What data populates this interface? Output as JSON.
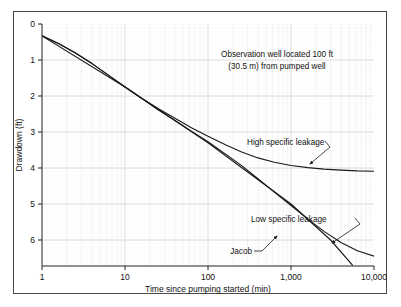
{
  "figure": {
    "background_color": "#ffffff",
    "frame_color": "#4a4a4a",
    "grid_color": "#d8d8d8",
    "grid_minor_color": "#e9e9e9",
    "curve_color": "#1a1a1a"
  },
  "annotations": {
    "note_line1": "Observation well located 100 ft",
    "note_line2": "(30.5 m) from pumped well",
    "high_leakage_label": "High specific leakage",
    "low_leakage_label": "Low specific leakage",
    "jacob_label": "Jacob"
  },
  "chart_data": {
    "type": "line",
    "title": "",
    "xlabel": "Time since pumping started (min)",
    "ylabel": "Drawdown (ft)",
    "xscale": "log",
    "yscale": "linear",
    "y_inverted": true,
    "xlim": [
      1,
      10000
    ],
    "ylim": [
      0,
      6.7
    ],
    "xticks": [
      1,
      10,
      100,
      1000,
      10000
    ],
    "xtick_labels": [
      "1",
      "10",
      "100",
      "1,000",
      "10,000"
    ],
    "yticks": [
      0,
      1,
      2,
      3,
      4,
      5,
      6
    ],
    "ytick_labels": [
      "0",
      "1",
      "2",
      "3",
      "4",
      "5",
      "6"
    ],
    "grid": true,
    "grid_style": "semi-log graph paper, minor log divisions on x, minor linear divisions on y",
    "legend": "none (curves labeled with leader lines)",
    "series": [
      {
        "name": "High specific leakage",
        "style": "solid",
        "points": [
          [
            1,
            0.33
          ],
          [
            1.6,
            0.55
          ],
          [
            2.5,
            0.8
          ],
          [
            4,
            1.1
          ],
          [
            6.3,
            1.42
          ],
          [
            10,
            1.75
          ],
          [
            16,
            2.07
          ],
          [
            25,
            2.35
          ],
          [
            40,
            2.62
          ],
          [
            63,
            2.88
          ],
          [
            100,
            3.12
          ],
          [
            160,
            3.35
          ],
          [
            250,
            3.55
          ],
          [
            400,
            3.72
          ],
          [
            630,
            3.84
          ],
          [
            1000,
            3.93
          ],
          [
            1600,
            3.99
          ],
          [
            2500,
            4.03
          ],
          [
            4000,
            4.06
          ],
          [
            6300,
            4.08
          ],
          [
            10000,
            4.09
          ]
        ]
      },
      {
        "name": "Low specific leakage",
        "style": "solid",
        "points": [
          [
            1,
            0.33
          ],
          [
            1.6,
            0.55
          ],
          [
            2.5,
            0.8
          ],
          [
            4,
            1.1
          ],
          [
            6.3,
            1.42
          ],
          [
            10,
            1.75
          ],
          [
            16,
            2.07
          ],
          [
            25,
            2.38
          ],
          [
            40,
            2.68
          ],
          [
            63,
            2.98
          ],
          [
            100,
            3.27
          ],
          [
            160,
            3.6
          ],
          [
            250,
            3.92
          ],
          [
            400,
            4.3
          ],
          [
            630,
            4.67
          ],
          [
            1000,
            5.04
          ],
          [
            1600,
            5.42
          ],
          [
            2500,
            5.76
          ],
          [
            4000,
            6.07
          ],
          [
            6300,
            6.3
          ],
          [
            10000,
            6.45
          ]
        ]
      },
      {
        "name": "Jacob",
        "style": "solid straight line (semi-log straight-line approximation)",
        "points": [
          [
            1,
            0.33
          ],
          [
            10,
            1.75
          ],
          [
            100,
            3.3
          ],
          [
            1000,
            5.0
          ],
          [
            3000,
            6.0
          ],
          [
            5500,
            6.7
          ]
        ]
      }
    ],
    "annotations": [
      {
        "text": "Observation well located 100 ft\n(30.5 m) from pumped well",
        "x": 300,
        "y": 0.9
      },
      {
        "text": "High specific leakage",
        "x": 800,
        "y": 3.45,
        "points_to": [
          1400,
          4.0
        ]
      },
      {
        "text": "Low specific leakage",
        "x": 1800,
        "y": 5.6,
        "points_to": [
          3800,
          6.25
        ]
      },
      {
        "text": "Jacob",
        "x": 700,
        "y": 6.25,
        "points_to": [
          1500,
          5.45
        ]
      }
    ]
  }
}
